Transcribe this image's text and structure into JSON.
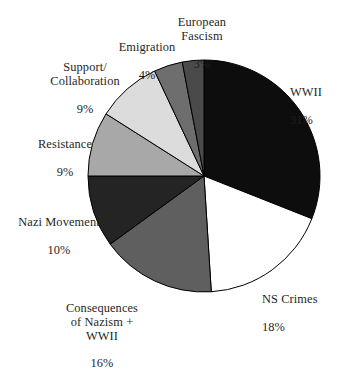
{
  "chart_data": {
    "type": "pie",
    "title": "",
    "subtitle": "",
    "xlabel": "",
    "ylabel": "",
    "legend_position": "none",
    "grid": false,
    "start_angle_deg": 0,
    "direction": "clockwise",
    "units": "percent",
    "categories": [
      "WWII",
      "NS Crimes",
      "Consequences of Nazism + WWII",
      "Nazi Movement",
      "Resistance",
      "Support/ Collaboration",
      "Emigration",
      "European Fascism"
    ],
    "values": [
      31,
      18,
      16,
      10,
      9,
      9,
      4,
      3
    ],
    "slices": [
      {
        "key": "wwii",
        "label": "WWII",
        "label_lines": "WWII",
        "percent_text": "31%",
        "value": 31,
        "color": "#0d0d0d",
        "stroke": "#000000"
      },
      {
        "key": "ns-crimes",
        "label": "NS Crimes",
        "label_lines": "NS Crimes",
        "percent_text": "18%",
        "value": 18,
        "color": "#ffffff",
        "stroke": "#000000"
      },
      {
        "key": "consequences",
        "label": "Consequences of Nazism + WWII",
        "label_lines": "Consequences\nof Nazism +\nWWII",
        "percent_text": "16%",
        "value": 16,
        "color": "#5f5f5f",
        "stroke": "#000000"
      },
      {
        "key": "nazi-movement",
        "label": "Nazi Movement",
        "label_lines": "Nazi Movement",
        "percent_text": "10%",
        "value": 10,
        "color": "#242424",
        "stroke": "#000000"
      },
      {
        "key": "resistance",
        "label": "Resistance",
        "label_lines": "Resistance",
        "percent_text": "9%",
        "value": 9,
        "color": "#a8a8a8",
        "stroke": "#000000"
      },
      {
        "key": "support-collaboration",
        "label": "Support/ Collaboration",
        "label_lines": "Support/\nCollaboration",
        "percent_text": "9%",
        "value": 9,
        "color": "#dcdcdc",
        "stroke": "#000000"
      },
      {
        "key": "emigration",
        "label": "Emigration",
        "label_lines": "Emigration",
        "percent_text": "4%",
        "value": 4,
        "color": "#6e6e6e",
        "stroke": "#000000"
      },
      {
        "key": "european-fascism",
        "label": "European Fascism",
        "label_lines": "European\nFascism",
        "percent_text": "3%",
        "value": 3,
        "color": "#4a4a4a",
        "stroke": "#000000"
      }
    ],
    "geometry": {
      "center_x": 204,
      "center_y": 176,
      "radius": 116
    },
    "background_color": "#ffffff",
    "text_color": "#1f1f1f"
  }
}
